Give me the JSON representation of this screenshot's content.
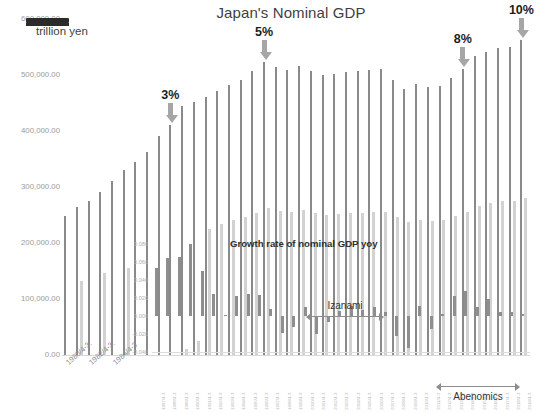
{
  "chart_data": {
    "type": "bar",
    "title": "Japan's Nominal GDP",
    "unit_label": "trillion yen",
    "xlabel": "",
    "ylabel": "",
    "ylim": [
      0,
      600000
    ],
    "ytick_labels": [
      "600,000.00",
      "500,000.00",
      "400,000.00",
      "300,000.00",
      "200,000.00",
      "100,000.00",
      "0.00"
    ],
    "ytick_values": [
      600000,
      500000,
      400000,
      300000,
      200000,
      100000,
      0
    ],
    "grid": false,
    "legend": "none",
    "categories": [
      "1980/4-3",
      "1981/4-3",
      "1982/4-3",
      "1983/4-3",
      "1984/4-3",
      "1985/4-3",
      "1986/4-3",
      "1987/4-3",
      "1988/4-3",
      "1989/4-3",
      "1990/4-3",
      "1991/4-3",
      "1992/4-3",
      "1993/4-3",
      "1994/4-3",
      "1995/4-3",
      "1996/4-3",
      "1997/4-3",
      "1998/4-3",
      "1999/4-3",
      "2000/4-3",
      "2001/4-3",
      "2002/4-3",
      "2003/4-3",
      "2004/4-3",
      "2005/4-3",
      "2006/4-3",
      "2007/4-3",
      "2008/4-3",
      "2009/4-3",
      "2010/4-3",
      "2011/4-3",
      "2012/4-3",
      "2013/4-3",
      "2014/4-3",
      "2015/4-3",
      "2016/4-3",
      "2017/4-3",
      "2018/4-3",
      "2019/4-3"
    ],
    "series": [
      {
        "name": "Nominal GDP",
        "color": "#8a8a8a",
        "values": [
          247000,
          264000,
          275000,
          290000,
          310000,
          330000,
          343000,
          362000,
          390000,
          410000,
          443000,
          450000,
          460000,
          470000,
          480000,
          490000,
          505000,
          521000,
          513000,
          508000,
          515000,
          505000,
          499000,
          501000,
          503000,
          505000,
          507000,
          510000,
          489000,
          474000,
          482000,
          477000,
          479000,
          494000,
          509000,
          532000,
          539000,
          547000,
          548000,
          560000
        ]
      },
      {
        "name": "Secondary series",
        "color": "#d2d2d2",
        "values": [
          0,
          131000,
          0,
          146000,
          0,
          155000,
          0,
          0,
          0,
          0,
          11000,
          25000,
          224000,
          234000,
          240000,
          245000,
          253000,
          261000,
          257000,
          254000,
          258000,
          253000,
          250000,
          251000,
          252000,
          253000,
          254000,
          255000,
          245000,
          237000,
          241000,
          239000,
          240000,
          247000,
          255000,
          266000,
          270000,
          274000,
          274000,
          280000
        ]
      }
    ],
    "annotations": [
      {
        "label": "3%",
        "x_index": 9,
        "kind": "down-arrow"
      },
      {
        "label": "5%",
        "x_index": 17,
        "kind": "down-arrow"
      },
      {
        "label": "8%",
        "x_index": 34,
        "kind": "down-arrow"
      },
      {
        "label": "10%",
        "x_index": 39,
        "kind": "down-arrow"
      }
    ]
  },
  "inner_chart_data": {
    "type": "bar",
    "title": "Growth rate of nominal GDP yoy",
    "ylim": [
      -0.04,
      0.08
    ],
    "ytick_labels": [
      "0.080",
      "0.060",
      "0.040",
      "0.020",
      "0.000",
      "-0.020",
      "-0.040"
    ],
    "ytick_values": [
      0.08,
      0.06,
      0.04,
      0.02,
      0.0,
      -0.02,
      -0.04
    ],
    "grid": false,
    "legend": "none",
    "categories": [
      "1987/4-3",
      "1988/4-3",
      "1989/4-3",
      "1990/4-3",
      "1991/4-3",
      "1992/4-3",
      "1993/4-3",
      "1994/4-3",
      "1995/4-3",
      "1996/4-3",
      "1997/4-3",
      "1998/4-3",
      "1999/4-3",
      "2000/4-3",
      "2001/4-3",
      "2002/4-3",
      "2003/4-3",
      "2004/4-3",
      "2005/4-3",
      "2006/4-3",
      "2007/4-3",
      "2008/4-3",
      "2009/4-3",
      "2010/4-3",
      "2011/4-3",
      "2012/4-3",
      "2013/4-3",
      "2014/4-3",
      "2015/4-3",
      "2016/4-3",
      "2017/4-3",
      "2018/4-3",
      "2019/4-3"
    ],
    "values": [
      0.053,
      0.065,
      0.066,
      0.08,
      0.05,
      0.024,
      0.001,
      0.022,
      0.025,
      0.023,
      0.008,
      -0.019,
      -0.012,
      0.01,
      -0.02,
      -0.007,
      0.006,
      0.011,
      0.007,
      0.01,
      0.005,
      -0.022,
      -0.035,
      0.011,
      -0.014,
      0.002,
      0.022,
      0.028,
      0.01,
      0.019,
      0.005,
      0.004,
      0.002
    ],
    "bar_color": "#8e8e8e",
    "span_annotations": [
      {
        "label": "Izanami",
        "kind": "double-arrow",
        "position": "above"
      },
      {
        "label": "Abenomics",
        "kind": "double-arrow",
        "position": "below"
      }
    ]
  }
}
